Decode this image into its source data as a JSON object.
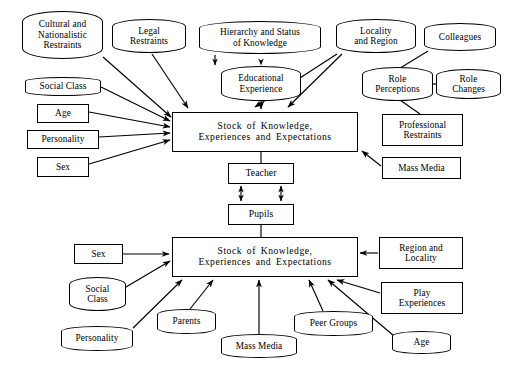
{
  "diagram": {
    "type": "influence-diagram",
    "stroke_color": "#000000",
    "background_color": "#ffffff",
    "nodes": [
      {
        "id": "cultural-nationalistic-restraints",
        "label": "Cultural and\nNationalistic\nRestraints",
        "shape": "rounded",
        "x": 22,
        "y": 11,
        "w": 81,
        "h": 48,
        "font": 9.3
      },
      {
        "id": "legal-restraints",
        "label": "Legal\nRestraints",
        "shape": "rounded",
        "x": 112,
        "y": 19,
        "w": 74,
        "h": 34,
        "font": 9.3
      },
      {
        "id": "hierarchy-status-knowledge",
        "label": "Hierarchy and Status\nof Knowledge",
        "shape": "rounded",
        "x": 199,
        "y": 21,
        "w": 122,
        "h": 33,
        "font": 9.3
      },
      {
        "id": "educational-experience",
        "label": "Educational\nExperience",
        "shape": "rounded",
        "x": 221,
        "y": 66,
        "w": 80,
        "h": 35,
        "font": 9.3
      },
      {
        "id": "locality-and-region",
        "label": "Locality\nand Region",
        "shape": "rounded",
        "x": 336,
        "y": 19,
        "w": 80,
        "h": 34,
        "font": 9.3
      },
      {
        "id": "colleagues",
        "label": "Colleagues",
        "shape": "rounded",
        "x": 424,
        "y": 23,
        "w": 72,
        "h": 28,
        "font": 9.3
      },
      {
        "id": "role-perceptions",
        "label": "Role\nPerceptions",
        "shape": "rounded",
        "x": 362,
        "y": 67,
        "w": 71,
        "h": 34,
        "font": 9.3
      },
      {
        "id": "role-changes",
        "label": "Role\nChanges",
        "shape": "rounded",
        "x": 436,
        "y": 69,
        "w": 65,
        "h": 30,
        "font": 9.3
      },
      {
        "id": "professional-restraints",
        "label": "Professional\nRestraints",
        "shape": "rect",
        "x": 382,
        "y": 114,
        "w": 81,
        "h": 32,
        "font": 9.3
      },
      {
        "id": "mass-media-top",
        "label": "Mass Media",
        "shape": "rect",
        "x": 382,
        "y": 157,
        "w": 79,
        "h": 22,
        "font": 9.3
      },
      {
        "id": "social-class-top",
        "label": "Social Class",
        "shape": "rounded",
        "x": 25,
        "y": 77,
        "w": 76,
        "h": 19,
        "font": 9.3
      },
      {
        "id": "age-top",
        "label": "Age",
        "shape": "rect",
        "x": 37,
        "y": 104,
        "w": 52,
        "h": 19,
        "font": 9.3
      },
      {
        "id": "personality-top",
        "label": "Personality",
        "shape": "rect",
        "x": 27,
        "y": 130,
        "w": 72,
        "h": 19,
        "font": 9.3
      },
      {
        "id": "sex-top",
        "label": "Sex",
        "shape": "rect",
        "x": 37,
        "y": 157,
        "w": 52,
        "h": 20,
        "font": 9.3
      },
      {
        "id": "stock-teacher",
        "label": "Stock of Knowledge,\nExperiences and Expectations",
        "shape": "rect",
        "x": 172,
        "y": 112,
        "w": 186,
        "h": 40,
        "font": 9.6
      },
      {
        "id": "teacher",
        "label": "Teacher",
        "shape": "rect",
        "x": 228,
        "y": 163,
        "w": 66,
        "h": 21,
        "font": 9.6
      },
      {
        "id": "pupils",
        "label": "Pupils",
        "shape": "rect",
        "x": 228,
        "y": 204,
        "w": 66,
        "h": 21,
        "font": 9.6
      },
      {
        "id": "stock-pupil",
        "label": "Stock of Knowledge,\nExperiences and Expectations",
        "shape": "rect",
        "x": 172,
        "y": 237,
        "w": 186,
        "h": 40,
        "font": 9.6
      },
      {
        "id": "sex-bottom",
        "label": "Sex",
        "shape": "rect",
        "x": 74,
        "y": 244,
        "w": 49,
        "h": 20,
        "font": 9.3
      },
      {
        "id": "social-class-bottom",
        "label": "Social\nClass",
        "shape": "rounded",
        "x": 69,
        "y": 277,
        "w": 57,
        "h": 34,
        "font": 9.3
      },
      {
        "id": "personality-bottom",
        "label": "Personality",
        "shape": "rounded",
        "x": 61,
        "y": 326,
        "w": 72,
        "h": 25,
        "font": 9.3
      },
      {
        "id": "parents",
        "label": "Parents",
        "shape": "rounded",
        "x": 157,
        "y": 309,
        "w": 59,
        "h": 25,
        "font": 9.3
      },
      {
        "id": "mass-media-bottom",
        "label": "Mass Media",
        "shape": "rounded",
        "x": 221,
        "y": 334,
        "w": 76,
        "h": 24,
        "font": 9.3
      },
      {
        "id": "peer-groups",
        "label": "Peer Groups",
        "shape": "rounded",
        "x": 294,
        "y": 311,
        "w": 79,
        "h": 25,
        "font": 9.3
      },
      {
        "id": "age-bottom",
        "label": "Age",
        "shape": "rounded",
        "x": 392,
        "y": 331,
        "w": 59,
        "h": 23,
        "font": 9.3
      },
      {
        "id": "region-and-locality",
        "label": "Region and\nLocality",
        "shape": "rect",
        "x": 379,
        "y": 237,
        "w": 84,
        "h": 32,
        "font": 9.3
      },
      {
        "id": "play-experiences",
        "label": "Play\nExperiences",
        "shape": "rect",
        "x": 381,
        "y": 282,
        "w": 82,
        "h": 32,
        "font": 9.3
      }
    ],
    "edges": [
      {
        "from": "cultural-nationalistic-restraints",
        "to": "stock-teacher",
        "arrow": "single",
        "path": "M 103,57 L 170,118"
      },
      {
        "from": "legal-restraints",
        "to": "stock-teacher",
        "arrow": "single",
        "path": "M 152,54 L 187,109"
      },
      {
        "from": "hierarchy-status-knowledge",
        "to": "educational-experience",
        "arrow": "none",
        "path": "M 215,55 L 215,66"
      },
      {
        "from": "educational-experience",
        "to": "stock-teacher",
        "arrow": "single",
        "path": "M 223,102 L 223,109"
      },
      {
        "from": "locality-and-region",
        "to": "stock-teacher",
        "arrow": "single",
        "path": "M 339,54 L 285,109"
      },
      {
        "from": "locality-and-region-second",
        "to": "stock-teacher",
        "arrow": "single",
        "path": "M 336,54 L 252,109"
      },
      {
        "from": "colleagues",
        "to": "role-perceptions",
        "arrow": "none",
        "path": "M 428,50 L 396,70"
      },
      {
        "from": "role-changes",
        "to": "role-perceptions",
        "arrow": "none",
        "path": "M 437,84 L 418,84"
      },
      {
        "from": "role-perceptions",
        "to": "professional-restraints",
        "arrow": "none",
        "path": "M 399,99 L 420,114"
      },
      {
        "from": "mass-media-top",
        "to": "stock-teacher",
        "arrow": "single",
        "path": "M 382,166 L 360,150"
      },
      {
        "from": "social-class-top",
        "to": "stock-teacher",
        "arrow": "single",
        "path": "M 101,88 L 170,122"
      },
      {
        "from": "age-top",
        "to": "stock-teacher",
        "arrow": "single",
        "path": "M 89,113 L 170,128"
      },
      {
        "from": "personality-top",
        "to": "stock-teacher",
        "arrow": "single",
        "path": "M 99,138 L 170,134"
      },
      {
        "from": "sex-top",
        "to": "stock-teacher",
        "arrow": "single",
        "path": "M 89,165 L 170,140"
      },
      {
        "from": "stock-teacher",
        "to": "teacher",
        "arrow": "none",
        "path": "M 261,153 L 261,163"
      },
      {
        "from": "teacher",
        "to": "pupils",
        "arrow": "double",
        "path": "M 241,186 L 241,202"
      },
      {
        "from": "teacher",
        "to": "pupils",
        "arrow": "double",
        "path": "M 281,186 L 281,202"
      },
      {
        "from": "pupils",
        "to": "stock-pupil",
        "arrow": "none",
        "path": "M 261,226 L 261,237"
      },
      {
        "from": "sex-bottom",
        "to": "stock-pupil",
        "arrow": "single",
        "path": "M 123,254 L 170,254"
      },
      {
        "from": "social-class-bottom",
        "to": "stock-pupil",
        "arrow": "single",
        "path": "M 126,288 L 170,262"
      },
      {
        "from": "personality-bottom",
        "to": "stock-pupil",
        "arrow": "single",
        "path": "M 133,329 L 182,279"
      },
      {
        "from": "parents",
        "to": "stock-pupil",
        "arrow": "single",
        "path": "M 189,309 L 212,279"
      },
      {
        "from": "mass-media-bottom",
        "to": "stock-pupil",
        "arrow": "single",
        "path": "M 259,334 L 259,279"
      },
      {
        "from": "peer-groups",
        "to": "stock-pupil",
        "arrow": "single",
        "path": "M 323,311 L 308,279"
      },
      {
        "from": "age-bottom",
        "to": "stock-pupil",
        "arrow": "single",
        "path": "M 392,337 L 327,279"
      },
      {
        "from": "play-experiences",
        "to": "stock-pupil",
        "arrow": "single",
        "path": "M 381,293 L 335,279"
      },
      {
        "from": "region-and-locality",
        "to": "stock-pupil",
        "arrow": "single",
        "path": "M 379,253 L 361,253"
      }
    ]
  }
}
